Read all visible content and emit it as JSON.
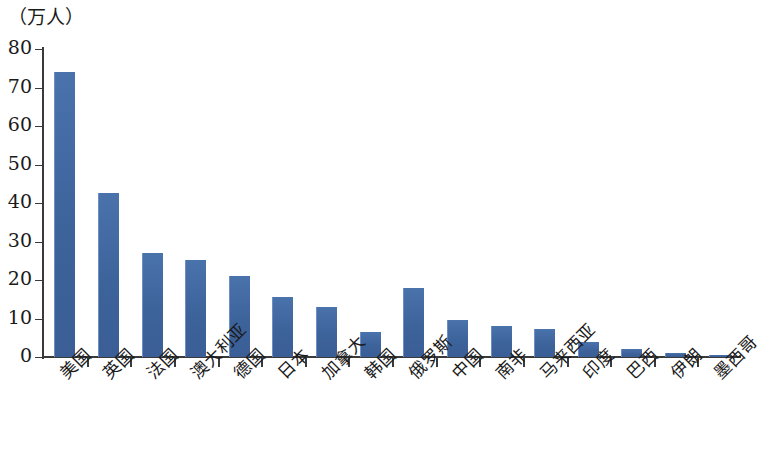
{
  "chart_data": {
    "type": "bar",
    "title": "",
    "unit_caption": "（万人）",
    "xlabel": "",
    "ylabel": "",
    "ylim": [
      0,
      80
    ],
    "ytick_labels": [
      "0",
      "10",
      "20",
      "30",
      "40",
      "50",
      "60",
      "70",
      "80"
    ],
    "ytick_values": [
      0,
      10,
      20,
      30,
      40,
      50,
      60,
      70,
      80
    ],
    "grid": false,
    "legend": "none",
    "bar_color": "#40679f",
    "axis_color": "#3a3a3a",
    "categories": [
      "美国",
      "英国",
      "法国",
      "澳大利亚",
      "德国",
      "日本",
      "加拿大",
      "韩国",
      "俄罗斯",
      "中国",
      "南非",
      "马来西亚",
      "印度",
      "巴西",
      "伊朗",
      "墨西哥"
    ],
    "values": [
      74,
      42.5,
      27,
      25.3,
      21,
      15.6,
      13,
      6.6,
      18,
      9.7,
      8,
      7.3,
      4,
      2.2,
      1,
      0.5
    ]
  }
}
